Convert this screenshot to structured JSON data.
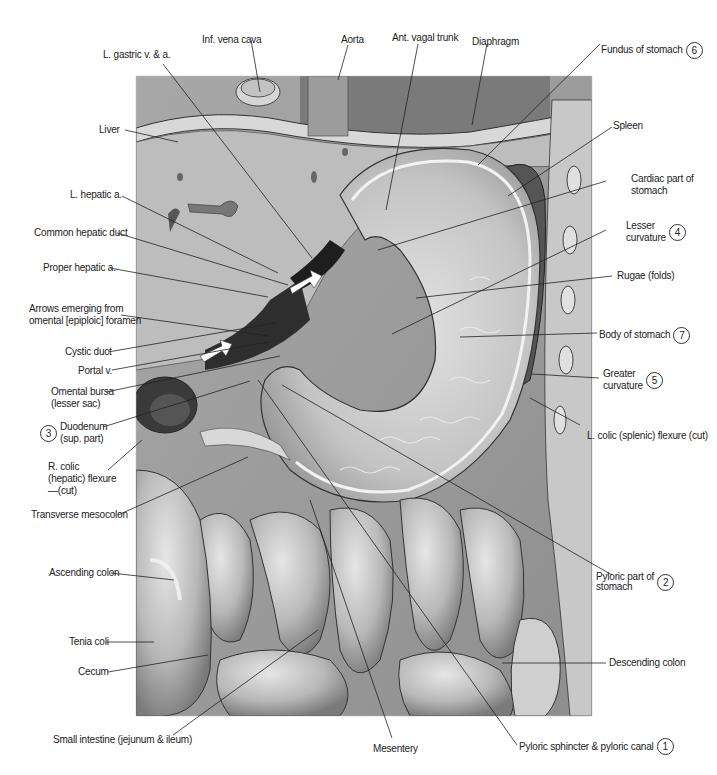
{
  "figure": {
    "colors": {
      "background": "#ffffff",
      "illustration_base": "#b4b4b4",
      "liver": "#bdbdbd",
      "stomach_interior": "#cfcfcf",
      "leader_line": "#222222",
      "label_text": "#222222"
    }
  },
  "labels": {
    "inf_vena_cava": "Inf. vena cava",
    "aorta": "Aorta",
    "ant_vagal_trunk": "Ant. vagal trunk",
    "diaphragm": "Diaphragm",
    "l_gastric": "L. gastric v. & a.",
    "fundus": "Fundus of stomach",
    "fundus_num": "6",
    "liver": "Liver",
    "spleen": "Spleen",
    "cardiac_1": "Cardiac part of",
    "cardiac_2": "stomach",
    "l_hepatic": "L. hepatic a.",
    "common_hepatic_duct": "Common hepatic duct",
    "lesser_curv_1": "Lesser",
    "lesser_curv_2": "curvature",
    "lesser_curv_num": "4",
    "proper_hepatic": "Proper hepatic a.",
    "rugae": "Rugae (folds)",
    "arrows_1": "Arrows emerging from",
    "arrows_2": "omental [epiploic] foramen",
    "body": "Body of stomach",
    "body_num": "7",
    "cystic_duct": "Cystic duct",
    "portal_v": "Portal v.",
    "greater_curv_1": "Greater",
    "greater_curv_2": "curvature",
    "greater_curv_num": "5",
    "omental_bursa_1": "Omental bursa",
    "omental_bursa_2": "(lesser sac)",
    "duodenum_1": "Duodenum",
    "duodenum_2": "(sup. part)",
    "duodenum_num": "3",
    "l_colic": "L. colic (splenic) flexure (cut)",
    "r_colic_1": "R. colic",
    "r_colic_2": "(hepatic) flexure",
    "r_colic_3": "—(cut)",
    "transverse_mesocolon": "Transverse mesocolon",
    "pyloric_part_1": "Pyloric part of",
    "pyloric_part_2": "stomach",
    "pyloric_part_num": "2",
    "ascending_colon": "Ascending colon",
    "tenia_coli": "Tenia coli",
    "cecum": "Cecum",
    "descending_colon": "Descending colon",
    "small_intestine": "Small intestine (jejunum & ileum)",
    "mesentery": "Mesentery",
    "pyloric_sphincter": "Pyloric sphincter & pyloric canal",
    "pyloric_sphincter_num": "1"
  }
}
